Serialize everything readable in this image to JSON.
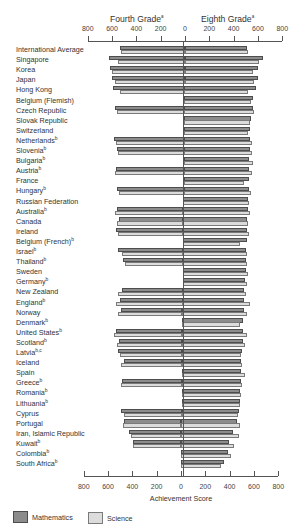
{
  "chart_data": {
    "type": "bar",
    "orientation": "horizontal-back-to-back",
    "title": "",
    "xlabel": "Achievement Score",
    "ylabel": "",
    "panels": [
      {
        "name": "Fourth Grade",
        "superscript": "a",
        "side": "left",
        "xlim": [
          0,
          800
        ]
      },
      {
        "name": "Eighth Grade",
        "superscript": "a",
        "side": "right",
        "xlim": [
          0,
          800
        ]
      }
    ],
    "ticks": [
      800,
      600,
      400,
      200,
      0,
      200,
      400,
      600,
      800
    ],
    "legend": [
      {
        "name": "Mathematics",
        "color": "#8c8c8c"
      },
      {
        "name": "Science",
        "color": "#dcdcdc"
      }
    ],
    "legend_position": "bottom-left",
    "grid": false,
    "categories": [
      {
        "name": "International Average",
        "sup": ""
      },
      {
        "name": "Singapore",
        "sup": ""
      },
      {
        "name": "Korea",
        "sup": ""
      },
      {
        "name": "Japan",
        "sup": ""
      },
      {
        "name": "Hong Kong",
        "sup": ""
      },
      {
        "name": "Belgium (Flemish)",
        "sup": ""
      },
      {
        "name": "Czech Republic",
        "sup": ""
      },
      {
        "name": "Slovak Republic",
        "sup": ""
      },
      {
        "name": "Switzerland",
        "sup": ""
      },
      {
        "name": "Netherlands",
        "sup": "b"
      },
      {
        "name": "Slovenia",
        "sup": "b"
      },
      {
        "name": "Bulgaria",
        "sup": "b"
      },
      {
        "name": "Austria",
        "sup": "b"
      },
      {
        "name": "France",
        "sup": ""
      },
      {
        "name": "Hungary",
        "sup": "b"
      },
      {
        "name": "Russian Federation",
        "sup": ""
      },
      {
        "name": "Australia",
        "sup": "b"
      },
      {
        "name": "Canada",
        "sup": ""
      },
      {
        "name": "Ireland",
        "sup": ""
      },
      {
        "name": "Belgium (French)",
        "sup": "b"
      },
      {
        "name": "Israel",
        "sup": "b"
      },
      {
        "name": "Thailand",
        "sup": "b"
      },
      {
        "name": "Sweden",
        "sup": ""
      },
      {
        "name": "Germany",
        "sup": "b"
      },
      {
        "name": "New Zealand",
        "sup": ""
      },
      {
        "name": "England",
        "sup": "b"
      },
      {
        "name": "Norway",
        "sup": ""
      },
      {
        "name": "Denmark",
        "sup": "b"
      },
      {
        "name": "United States",
        "sup": "b"
      },
      {
        "name": "Scotland",
        "sup": "b"
      },
      {
        "name": "Latvia",
        "sup": "b,c"
      },
      {
        "name": "Iceland",
        "sup": ""
      },
      {
        "name": "Spain",
        "sup": ""
      },
      {
        "name": "Greece",
        "sup": "b"
      },
      {
        "name": "Romania",
        "sup": "b"
      },
      {
        "name": "Lithuania",
        "sup": "b"
      },
      {
        "name": "Cyprus",
        "sup": ""
      },
      {
        "name": "Portugal",
        "sup": ""
      },
      {
        "name": "Iran, Islamic Republic",
        "sup": ""
      },
      {
        "name": "Kuwait",
        "sup": "b"
      },
      {
        "name": "Colombia",
        "sup": "b"
      },
      {
        "name": "South Africa",
        "sup": "b"
      }
    ],
    "series": [
      {
        "name": "Fourth Grade Mathematics",
        "values": [
          529,
          625,
          611,
          597,
          587,
          null,
          567,
          null,
          null,
          577,
          552,
          null,
          559,
          null,
          548,
          null,
          546,
          532,
          550,
          null,
          531,
          490,
          null,
          null,
          499,
          513,
          502,
          null,
          545,
          520,
          525,
          474,
          null,
          492,
          null,
          null,
          502,
          475,
          429,
          400,
          null,
          null
        ]
      },
      {
        "name": "Fourth Grade Science",
        "values": [
          524,
          547,
          597,
          574,
          533,
          null,
          557,
          null,
          null,
          557,
          546,
          null,
          565,
          null,
          532,
          null,
          562,
          549,
          539,
          null,
          505,
          473,
          null,
          null,
          531,
          551,
          530,
          null,
          565,
          536,
          512,
          505,
          null,
          497,
          null,
          null,
          475,
          480,
          416,
          401,
          null,
          null
        ]
      },
      {
        "name": "Eighth Grade Mathematics",
        "values": [
          513,
          643,
          607,
          605,
          588,
          565,
          564,
          547,
          545,
          541,
          541,
          540,
          539,
          538,
          537,
          535,
          530,
          527,
          527,
          526,
          522,
          522,
          519,
          509,
          508,
          506,
          503,
          502,
          500,
          498,
          493,
          487,
          487,
          484,
          482,
          477,
          474,
          454,
          428,
          392,
          385,
          354
        ]
      },
      {
        "name": "Eighth Grade Science",
        "values": [
          516,
          607,
          565,
          571,
          522,
          550,
          574,
          544,
          522,
          560,
          560,
          565,
          558,
          498,
          554,
          538,
          545,
          531,
          538,
          471,
          524,
          525,
          535,
          531,
          525,
          552,
          527,
          478,
          534,
          517,
          485,
          494,
          517,
          497,
          486,
          476,
          463,
          480,
          470,
          430,
          411,
          326
        ]
      }
    ]
  },
  "headers": {
    "fourth_grade": "Fourth Grade",
    "eighth_grade": "Eighth Grade",
    "superscript": "a"
  },
  "axis": {
    "xlabel": "Achievement Score",
    "tick_labels": [
      "800",
      "600",
      "400",
      "200",
      "0",
      "200",
      "400",
      "600",
      "800"
    ]
  },
  "legend": {
    "math_label": "Mathematics",
    "science_label": "Science",
    "math_color": "#8c8c8c",
    "science_color": "#dcdcdc"
  }
}
